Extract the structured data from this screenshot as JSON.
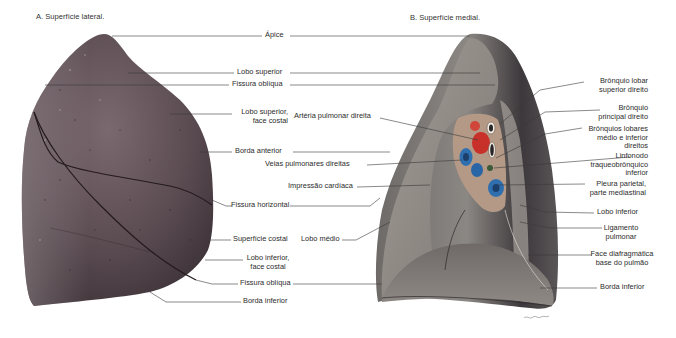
{
  "figure": {
    "panel_a_title": "A. Superfície lateral.",
    "panel_b_title": "B. Superfície  medial."
  },
  "labels": {
    "apice": "Ápice",
    "lobo_superior": "Lobo superior",
    "fissura_obliqua_top": "Fissura oblíqua",
    "lobo_superior_face_costal_1": "Lobo superior,",
    "lobo_superior_face_costal_2": "face  costal",
    "arteria_pulmonar_direita": "Artéria pulmonar direita",
    "borda_anterior": "Borda anterior",
    "veias_pulmonares_direitas": "Veias pulmonares direitas",
    "impressao_cardiaca": "Impressão cardíaca",
    "fissura_horizontal": "Fissura horizontal",
    "superficie_costal": "Superfície costal",
    "lobo_medio": "Lobo médio",
    "lobo_inferior_face_costal_1": "Lobo inferior,",
    "lobo_inferior_face_costal_2": "face costal",
    "fissura_obliqua_bottom": "Fissura oblíqua",
    "borda_inferior_a": "Borda  inferior",
    "bronquio_lobar_superior_1": "Brônquio lobar",
    "bronquio_lobar_superior_2": "superior direito",
    "bronquio_principal_1": "Brônquio",
    "bronquio_principal_2": "principal direito",
    "bronquios_lobares_1": "Brônquios lobares",
    "bronquios_lobares_2": "médio e inferior",
    "bronquios_lobares_3": "direitos",
    "linfonodo_1": "Linfonodo",
    "linfonodo_2": "traqueobrônquico",
    "linfonodo_3": "inferior",
    "pleura_1": "Pleura parietal,",
    "pleura_2": "parte mediastinal",
    "lobo_inferior": "Lobo inferior",
    "ligamento_1": "Ligamento",
    "ligamento_2": "pulmonar",
    "face_diafragmatica_1": "Face diafragmática",
    "face_diafragmatica_2": "base do pulmão",
    "borda_inferior_b": "Borda inferior"
  },
  "colors": {
    "lung_lateral": "#5e4f55",
    "lung_medial_surface": "#8a8682",
    "lung_medial_dark": "#3f3a3d",
    "artery": "#c8302a",
    "vein": "#2f6fb0",
    "leader_line": "#3a3a3a"
  }
}
